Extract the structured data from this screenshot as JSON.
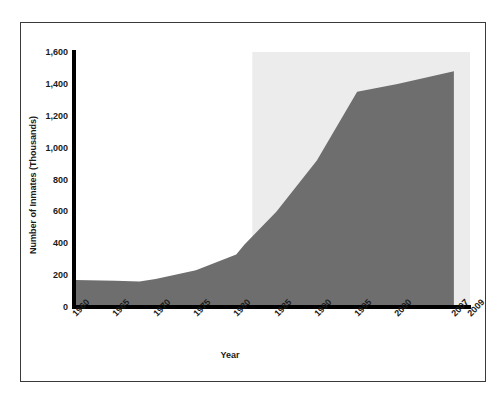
{
  "chart_data": {
    "type": "area",
    "title": "",
    "xlabel": "Year",
    "ylabel": "Number of Inmates (Thousands)",
    "xlim": [
      1960,
      2009
    ],
    "ylim": [
      0,
      1600
    ],
    "grid": false,
    "legend": null,
    "series_name": "Number of Inmates (Thousands)",
    "x": [
      1960,
      1965,
      1968,
      1970,
      1975,
      1980,
      1981,
      1985,
      1990,
      1995,
      2000,
      2007
    ],
    "values": [
      170,
      165,
      160,
      175,
      230,
      330,
      390,
      600,
      920,
      1350,
      1400,
      1480
    ],
    "x_tick_labels": [
      "1960",
      "1965",
      "1970",
      "1975",
      "1980",
      "1985",
      "1990",
      "1995",
      "2000",
      "2007",
      "2009"
    ],
    "x_tick_values": [
      1960,
      1965,
      1970,
      1975,
      1980,
      1985,
      1990,
      1995,
      2000,
      2007,
      2009
    ],
    "y_tick_labels": [
      "0",
      "200",
      "400",
      "600",
      "800",
      "1,000",
      "1,200",
      "1,400",
      "1,600"
    ],
    "y_tick_values": [
      0,
      200,
      400,
      600,
      800,
      1000,
      1200,
      1400,
      1600
    ],
    "area_fill_color": "#6e6e6e",
    "highlight_band": {
      "x_start": 1982,
      "x_end": 2009,
      "color": "#ececec"
    },
    "axis_color": "#000000",
    "frame_color": "#3a3a3a",
    "background_color": "#ffffff"
  }
}
